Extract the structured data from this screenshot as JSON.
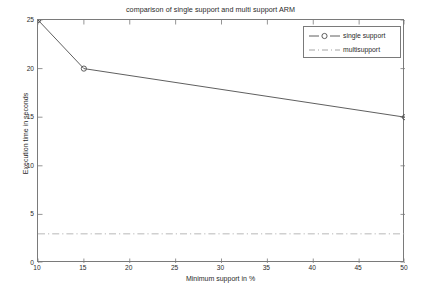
{
  "chart_data": {
    "type": "line",
    "title": "comparison of single support and multi support ARM",
    "xlabel": "Minimum support in %",
    "ylabel": "Execution time in seconds",
    "xlim": [
      10,
      50
    ],
    "ylim": [
      0,
      25
    ],
    "xticks": [
      10,
      15,
      20,
      25,
      30,
      35,
      40,
      45,
      50
    ],
    "yticks": [
      0,
      5,
      10,
      15,
      20,
      25
    ],
    "xtick_labels": [
      "10",
      "15",
      "20",
      "25",
      "30",
      "35",
      "40",
      "45",
      "50"
    ],
    "ytick_labels": [
      "0",
      "5",
      "10",
      "15",
      "20",
      "25"
    ],
    "grid": false,
    "legend_position": "top-right",
    "series": [
      {
        "name": "single support",
        "style": "solid",
        "marker": "open-circle",
        "color": "#4d4d4d",
        "x": [
          10,
          15,
          50
        ],
        "values": [
          25,
          20,
          15
        ]
      },
      {
        "name": "multisupport",
        "style": "dash-dot",
        "marker": "none",
        "color": "#b0b0b0",
        "x": [
          10,
          50
        ],
        "values": [
          3,
          3
        ]
      }
    ]
  },
  "legend": {
    "entries": [
      {
        "label": "single support"
      },
      {
        "label": "multisupport"
      }
    ]
  },
  "colors": {
    "axis": "#7a7a7a",
    "series_single": "#4d4d4d",
    "series_multi": "#b0b0b0",
    "text": "#2a2a2a",
    "background": "#ffffff"
  }
}
